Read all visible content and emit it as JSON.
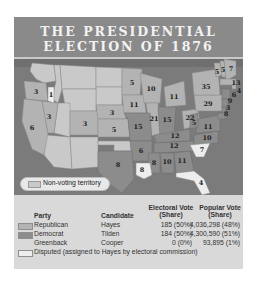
{
  "title": {
    "line1": "THE PRESIDENTIAL",
    "line2": "ELECTION OF 1876"
  },
  "colors": {
    "title_bg": "#8a8a8a",
    "ocean": "#7b7b7b",
    "republican": "#b3b3b3",
    "democrat": "#8c8c8c",
    "disputed": "#ededed",
    "nonvoting": "#c9c9c9",
    "panel_bg": "#d9d9d9"
  },
  "map": {
    "nonvoting_label": "Non-voting territory",
    "state_labels": [
      {
        "state": "OR",
        "votes": "3"
      },
      {
        "state": "ID-disputed",
        "votes": "1"
      },
      {
        "state": "NV",
        "votes": "3"
      },
      {
        "state": "CA",
        "votes": "6"
      },
      {
        "state": "CO",
        "votes": "3"
      },
      {
        "state": "NE",
        "votes": "3"
      },
      {
        "state": "KS",
        "votes": "5"
      },
      {
        "state": "MN",
        "votes": "5"
      },
      {
        "state": "IA",
        "votes": "11"
      },
      {
        "state": "MO",
        "votes": "15"
      },
      {
        "state": "AR",
        "votes": "6"
      },
      {
        "state": "TX",
        "votes": "8"
      },
      {
        "state": "LA",
        "votes": "8"
      },
      {
        "state": "WI",
        "votes": "10"
      },
      {
        "state": "IL",
        "votes": "21"
      },
      {
        "state": "MI",
        "votes": "11"
      },
      {
        "state": "IN",
        "votes": "15"
      },
      {
        "state": "OH",
        "votes": "22"
      },
      {
        "state": "KY",
        "votes": "12"
      },
      {
        "state": "TN",
        "votes": "12"
      },
      {
        "state": "MS",
        "votes": "8"
      },
      {
        "state": "AL",
        "votes": "10"
      },
      {
        "state": "GA",
        "votes": "11"
      },
      {
        "state": "FL",
        "votes": "4"
      },
      {
        "state": "SC",
        "votes": "7"
      },
      {
        "state": "NC",
        "votes": "10"
      },
      {
        "state": "VA",
        "votes": "11"
      },
      {
        "state": "WV",
        "votes": "5"
      },
      {
        "state": "PA",
        "votes": "29"
      },
      {
        "state": "NY",
        "votes": "35"
      },
      {
        "state": "VT",
        "votes": "5"
      },
      {
        "state": "NH",
        "votes": "5"
      },
      {
        "state": "ME",
        "votes": "7"
      },
      {
        "state": "MA",
        "votes": "13"
      },
      {
        "state": "RI",
        "votes": "4"
      },
      {
        "state": "CT",
        "votes": "6"
      },
      {
        "state": "NJ",
        "votes": "9"
      },
      {
        "state": "DE",
        "votes": "3"
      },
      {
        "state": "MD",
        "votes": "8"
      }
    ]
  },
  "legend": {
    "headers": {
      "party": "Party",
      "candidate": "Candidate",
      "electoral_line1": "Electoral Vote",
      "electoral_line2": "(Share)",
      "popular_line1": "Popular Vote",
      "popular_line2": "(Share)"
    },
    "rows": [
      {
        "party": "Republican",
        "candidate": "Hayes",
        "electoral": "185 (50%)",
        "popular": "4,036,298 (48%)"
      },
      {
        "party": "Democrat",
        "candidate": "Tilden",
        "electoral": "184 (50%)",
        "popular": "4,300,590 (51%)"
      },
      {
        "party": "Greenback",
        "candidate": "Cooper",
        "electoral": "0 (0%)",
        "popular": "93,895 (1%)"
      }
    ],
    "disputed_note": "Disputed (assigned to Hayes by electoral commission)"
  }
}
